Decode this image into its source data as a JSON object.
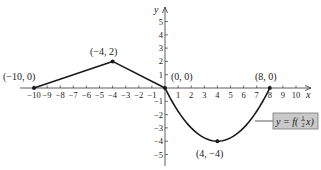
{
  "chart_data": {
    "type": "line",
    "title": "",
    "xlabel": "x",
    "ylabel": "y",
    "xlim": [
      -10.5,
      11
    ],
    "ylim": [
      -5.8,
      6
    ],
    "grid": false,
    "x_ticks": [
      -10,
      -9,
      -8,
      -7,
      -6,
      -5,
      -4,
      -3,
      -2,
      -1,
      1,
      2,
      3,
      4,
      5,
      6,
      7,
      8,
      9,
      10
    ],
    "x_tick_labels": [
      "-10",
      "-9",
      "-8",
      "-7",
      "-6",
      "-5",
      "-4",
      "-3",
      "-2",
      "-1",
      "1",
      "2",
      "3",
      "4",
      "5",
      "6",
      "7",
      "8",
      "9",
      "10"
    ],
    "y_ticks": [
      5,
      4,
      3,
      2,
      1,
      -1,
      -2,
      -3,
      -4,
      -5
    ],
    "y_tick_labels": [
      "5",
      "4",
      "3",
      "2",
      "1",
      "-1",
      "-2",
      "-3",
      "-4",
      "-5"
    ],
    "series": [
      {
        "name": "y = f(1/2 x)",
        "segments": [
          {
            "kind": "line",
            "x": [
              -10,
              -4
            ],
            "y": [
              0,
              2
            ]
          },
          {
            "kind": "line",
            "x": [
              -4,
              0
            ],
            "y": [
              2,
              0
            ]
          },
          {
            "kind": "curve",
            "x": [
              0,
              1,
              2,
              3,
              4,
              5,
              6,
              7,
              8
            ],
            "y": [
              0,
              -1.75,
              -3,
              -3.75,
              -4,
              -3.75,
              -3,
              -1.75,
              0
            ]
          }
        ]
      }
    ],
    "key_points": [
      {
        "x": -10,
        "y": 0,
        "label": "(−10, 0)"
      },
      {
        "x": -4,
        "y": 2,
        "label": "(−4, 2)"
      },
      {
        "x": 0,
        "y": 0,
        "label": "(0, 0)"
      },
      {
        "x": 8,
        "y": 0,
        "label": "(8, 0)"
      },
      {
        "x": 4,
        "y": -4,
        "label": "(4, −4)"
      }
    ],
    "annotations": [
      {
        "text": "y = f(½x)",
        "style": "gray-box",
        "points_to": "curve"
      }
    ]
  },
  "labels": {
    "x_axis": "x",
    "y_axis": "y",
    "pt_neg10_0": "(−10, 0)",
    "pt_neg4_2": "(−4, 2)",
    "pt_0_0": "(0, 0)",
    "pt_8_0": "(8, 0)",
    "pt_4_neg4": "(4, −4)",
    "func_y": "y = f(",
    "func_num": "1",
    "func_den": "2",
    "func_tail": "x)"
  },
  "colors": {
    "axis": "#333333",
    "curve": "#1a1a1a",
    "box_fill": "#c9c9c9",
    "box_stroke": "#777777"
  }
}
